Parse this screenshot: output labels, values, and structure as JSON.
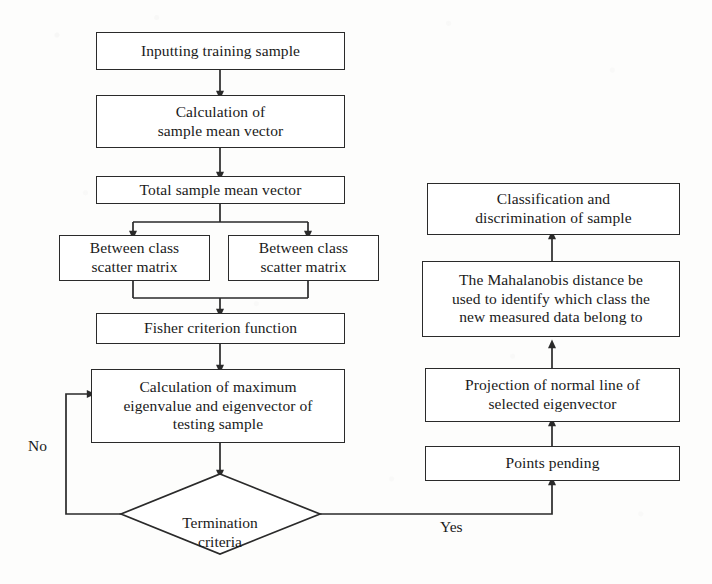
{
  "diagram": {
    "type": "flowchart",
    "background_color": "#fdfdfc",
    "line_color": "#2a2a2a",
    "text_color": "#1a1a1a"
  },
  "nodes": {
    "input_training_sample": {
      "label": "Inputting training sample",
      "shape": "rectangle"
    },
    "sample_mean_vector": {
      "label": "Calculation of\nsample mean vector",
      "shape": "rectangle"
    },
    "total_sample_mean_vector": {
      "label": "Total sample mean vector",
      "shape": "rectangle"
    },
    "between_class_scatter_left": {
      "label": "Between class\nscatter matrix",
      "shape": "rectangle"
    },
    "between_class_scatter_right": {
      "label": "Between class\nscatter matrix",
      "shape": "rectangle"
    },
    "fisher_criterion_function": {
      "label": "Fisher criterion function",
      "shape": "rectangle"
    },
    "max_eigenvalue": {
      "label": "Calculation of maximum\neigenvalue and eigenvector of\ntesting sample",
      "shape": "rectangle"
    },
    "termination_criteria": {
      "label": "Termination\ncriteria",
      "shape": "diamond"
    },
    "points_pending": {
      "label": "Points pending",
      "shape": "rectangle"
    },
    "projection_normal_line": {
      "label": "Projection of normal line of\nselected eigenvector",
      "shape": "rectangle"
    },
    "mahalanobis_distance": {
      "label": "The Mahalanobis distance be\nused to identify which class the\nnew measured data belong to",
      "shape": "rectangle"
    },
    "classification_discrimination": {
      "label": "Classification and\ndiscrimination of sample",
      "shape": "rectangle"
    }
  },
  "edge_labels": {
    "no_branch": "No",
    "yes_branch": "Yes"
  }
}
